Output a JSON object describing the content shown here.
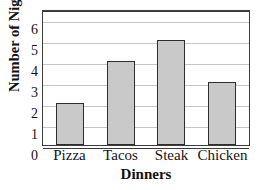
{
  "chart_data": {
    "type": "bar",
    "title": "JASON'S DINNERS",
    "xlabel": "Dinners",
    "ylabel": "Number of Nights",
    "categories": [
      "Pizza",
      "Tacos",
      "Steak",
      "Chicken"
    ],
    "values": [
      2,
      4,
      5,
      3
    ],
    "ylim": [
      0,
      6.5
    ],
    "yticks": [
      0,
      1,
      2,
      3,
      4,
      5,
      6
    ],
    "ytick_labels": [
      "0",
      "1",
      "2",
      "3",
      "4",
      "5",
      "6"
    ],
    "grid": true,
    "grid_axis": "y",
    "legend": false,
    "bar_fill_color": "#c9c9c9",
    "bar_edge_color": "#2e2e2e",
    "grid_color": "#c6c6c6",
    "axis_color": "#3c3c3c",
    "title_clipped": true
  }
}
